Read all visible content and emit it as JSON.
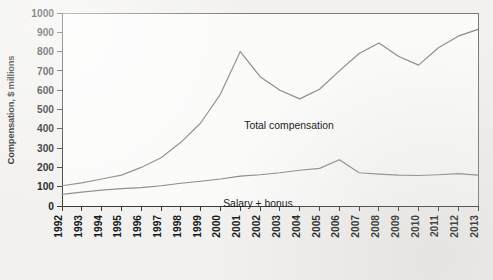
{
  "chart_data": {
    "type": "line",
    "title": "",
    "subtitle": "",
    "xlabel": "",
    "ylabel": "Compensation, $ millions",
    "x": [
      1992,
      1993,
      1994,
      1995,
      1996,
      1997,
      1998,
      1999,
      2000,
      2001,
      2002,
      2003,
      2004,
      2005,
      2006,
      2007,
      2008,
      2009,
      2010,
      2011,
      2012,
      2013
    ],
    "categories": [
      "1992",
      "1993",
      "1994",
      "1995",
      "1996",
      "1997",
      "1998",
      "1999",
      "2000",
      "2001",
      "2002",
      "2003",
      "2004",
      "2005",
      "2006",
      "2007",
      "2008",
      "2009",
      "2010",
      "2011",
      "2012",
      "2013"
    ],
    "xlim": [
      1992,
      2013
    ],
    "ylim": [
      0,
      1000
    ],
    "ytick_values": [
      0,
      100,
      200,
      300,
      400,
      500,
      600,
      700,
      800,
      900,
      1000
    ],
    "ytick_labels": [
      "0",
      "100",
      "200",
      "300",
      "400",
      "500",
      "600",
      "700",
      "800",
      "900",
      "1000"
    ],
    "grid": false,
    "legend_position": "inline-annotations",
    "series": [
      {
        "name": "Total compensation",
        "label_text": "Total compensation",
        "color": "#8c8c8e",
        "values": [
          105,
          120,
          140,
          160,
          200,
          250,
          330,
          430,
          580,
          800,
          670,
          600,
          555,
          605,
          700,
          790,
          845,
          775,
          730,
          820,
          880,
          915
        ]
      },
      {
        "name": "Salary + bonus",
        "label_text": "Salary + bonus",
        "color": "#8c8c8e",
        "values": [
          60,
          72,
          82,
          90,
          95,
          105,
          118,
          128,
          140,
          155,
          162,
          172,
          185,
          195,
          240,
          172,
          165,
          160,
          158,
          162,
          168,
          160
        ]
      }
    ],
    "annotations": [
      {
        "text": "Total compensation",
        "series": "Total compensation"
      },
      {
        "text": "Salary + bonus",
        "series": "Salary + bonus"
      }
    ]
  },
  "colors": {
    "background": "#f2f1ef",
    "plot_background": "#fbfbfa",
    "axis": "#3a3a3a",
    "frame": "#6a6a6a",
    "line": "#8c8c8e",
    "text": "#16181a"
  }
}
